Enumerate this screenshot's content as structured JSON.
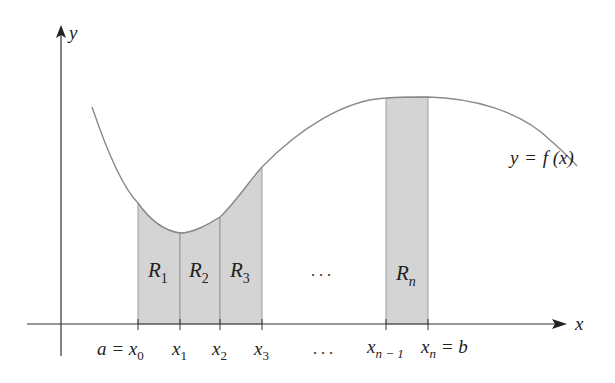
{
  "figure": {
    "axes": {
      "x_label": "x",
      "y_label": "y"
    },
    "curve_label": {
      "lhs": "y",
      "eq": "=",
      "func": "f",
      "arg": "(x)"
    },
    "rectangles": [
      {
        "label": "R",
        "sub": "1"
      },
      {
        "label": "R",
        "sub": "2"
      },
      {
        "label": "R",
        "sub": "3"
      },
      {
        "label": "R",
        "sub": "n"
      }
    ],
    "rect_ellipsis": ". . .",
    "ticks": [
      {
        "prefix": "a = ",
        "var": "x",
        "sub": "0",
        "suffix": ""
      },
      {
        "prefix": "",
        "var": "x",
        "sub": "1",
        "suffix": ""
      },
      {
        "prefix": "",
        "var": "x",
        "sub": "2",
        "suffix": ""
      },
      {
        "prefix": "",
        "var": "x",
        "sub": "3",
        "suffix": ""
      },
      {
        "prefix": "",
        "var": "x",
        "sub": "n − 1",
        "suffix": ""
      },
      {
        "prefix": "",
        "var": "x",
        "sub": "n",
        "suffix": " = b"
      }
    ],
    "tick_ellipsis": ". . .",
    "colors": {
      "axis": "#333333",
      "curve": "#8a8a8a",
      "rect_fill": "#d4d4d4",
      "rect_edge": "#8c8c8c"
    }
  }
}
